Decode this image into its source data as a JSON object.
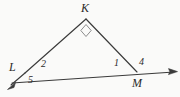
{
  "figure": {
    "kind": "geometry-diagram",
    "background_color": "#fafaf9",
    "stroke_color": "#3a3a3a",
    "label_color": "#2b2b2b"
  },
  "vertices": [
    {
      "id": "K",
      "label": "K",
      "x": 86,
      "y": 18
    },
    {
      "id": "L",
      "label": "L",
      "x": 25,
      "y": 73
    },
    {
      "id": "M",
      "label": "M",
      "x": 137,
      "y": 72
    }
  ],
  "angle_labels": [
    {
      "id": "1",
      "label": "1",
      "at_vertex": "M",
      "x": 114,
      "y": 58
    },
    {
      "id": "2",
      "label": "2",
      "at_vertex": "L",
      "x": 41,
      "y": 59
    },
    {
      "id": "4",
      "label": "4",
      "at_vertex": "M",
      "x": 139,
      "y": 57
    },
    {
      "id": "5",
      "label": "5",
      "at_vertex": "L",
      "x": 28,
      "y": 75
    }
  ],
  "markers": [
    {
      "id": "right-angle-K",
      "type": "right-angle-square",
      "at_vertex": "K"
    }
  ],
  "segments": [
    {
      "id": "KL",
      "from": "K",
      "to": "L"
    },
    {
      "id": "KM",
      "from": "K",
      "to": "M"
    },
    {
      "id": "baseline-LM",
      "from": "L",
      "to": "M"
    }
  ],
  "rays": [
    {
      "id": "ray-beyond-L",
      "direction": "down-left",
      "arrow": true
    },
    {
      "id": "ray-beyond-M",
      "direction": "right",
      "arrow": true
    }
  ]
}
